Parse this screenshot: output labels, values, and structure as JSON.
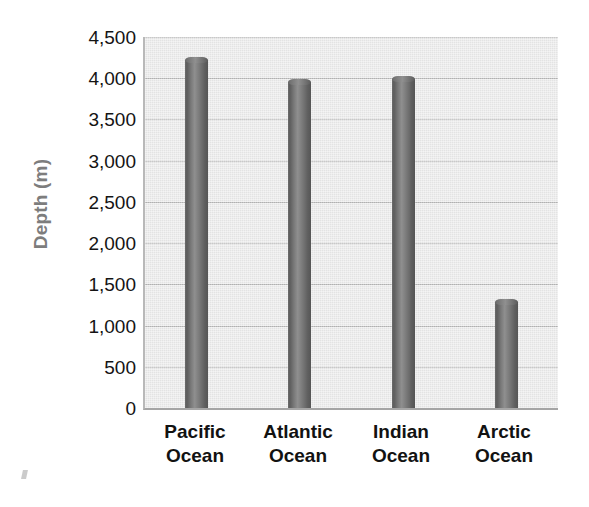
{
  "chart_data": {
    "type": "bar",
    "title": "",
    "xlabel": "",
    "ylabel": "Depth (m)",
    "categories": [
      "Pacific Ocean",
      "Atlantic Ocean",
      "Indian Ocean",
      "Arctic Ocean"
    ],
    "category_lines": [
      [
        "Pacific",
        "Ocean"
      ],
      [
        "Atlantic",
        "Ocean"
      ],
      [
        "Indian",
        "Ocean"
      ],
      [
        "Arctic",
        "Ocean"
      ]
    ],
    "values": [
      4220,
      3950,
      3990,
      1285
    ],
    "ylim": [
      0,
      4500
    ],
    "ytick_values": [
      4500,
      4000,
      3500,
      3000,
      2500,
      2000,
      1500,
      1000,
      500,
      0
    ],
    "ytick_labels": [
      "4,500",
      "4,000",
      "3,500",
      "3,000",
      "2,500",
      "2,000",
      "1,500",
      "1,000",
      "500",
      "0"
    ],
    "grid": true,
    "legend": false,
    "legend_position": "none",
    "bar_style": "cylinder",
    "colors": {
      "bar_light": "#8f8f8f",
      "bar_dark": "#565656",
      "plot_background": "#e9e9e9",
      "gridline": "#b4b4b4",
      "axis_line": "#a5a5a5",
      "tick_label": "#141414",
      "axis_title": "#7d7d7d"
    }
  }
}
